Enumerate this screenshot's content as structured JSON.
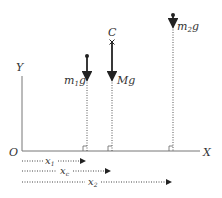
{
  "diagram": {
    "axes": {
      "origin_label": "O",
      "x_label": "X",
      "y_label": "Y"
    },
    "masses": [
      {
        "id": "m1",
        "force_label_main": "m",
        "force_label_sub": "1",
        "force_label_tail": "g"
      },
      {
        "id": "center",
        "point_label": "C",
        "force_label": "Mg"
      },
      {
        "id": "m2",
        "force_label_main": "m",
        "force_label_sub": "2",
        "force_label_tail": "g"
      }
    ],
    "distances": [
      {
        "main": "x",
        "sub": "1"
      },
      {
        "main": "x",
        "sub": "c"
      },
      {
        "main": "x",
        "sub": "2"
      }
    ],
    "colors": {
      "line": "#333333",
      "axis": "#555555"
    }
  }
}
